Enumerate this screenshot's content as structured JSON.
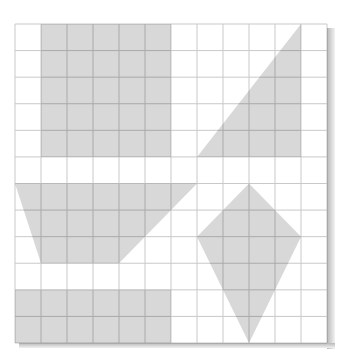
{
  "diagram": {
    "grid": {
      "columns": 12,
      "rows": 12,
      "origin_x": 15,
      "origin_y": 24,
      "cell_width": 26,
      "cell_height": 26.583,
      "line_color_light": "#c9c9c9",
      "line_color_on_fill": "#9a9a9a",
      "background": "#ffffff",
      "shadow_color": "#bdbdbd"
    },
    "fill_color": "#d8d8d8",
    "shapes": [
      {
        "name": "rectangle-top-left",
        "type": "rectangle",
        "vertices_grid": [
          [
            1,
            0
          ],
          [
            6,
            0
          ],
          [
            6,
            5
          ],
          [
            1,
            5
          ]
        ]
      },
      {
        "name": "right-triangle-top-right",
        "type": "triangle",
        "vertices_grid": [
          [
            11,
            0
          ],
          [
            11,
            5
          ],
          [
            7,
            5
          ]
        ]
      },
      {
        "name": "trapezoid-middle-left",
        "type": "trapezoid",
        "vertices_grid": [
          [
            0,
            6
          ],
          [
            7,
            6
          ],
          [
            4,
            9
          ],
          [
            1,
            9
          ]
        ]
      },
      {
        "name": "kite-bottom-right",
        "type": "kite",
        "vertices_grid": [
          [
            9,
            6
          ],
          [
            11,
            8
          ],
          [
            9,
            12
          ],
          [
            7,
            8
          ]
        ]
      },
      {
        "name": "rectangle-bottom-left",
        "type": "rectangle",
        "vertices_grid": [
          [
            0,
            10
          ],
          [
            6,
            10
          ],
          [
            6,
            12
          ],
          [
            0,
            12
          ]
        ]
      }
    ]
  }
}
